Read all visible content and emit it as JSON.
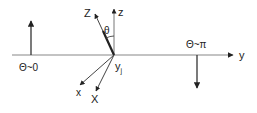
{
  "diagram": {
    "type": "coordinate-rotation-diagram",
    "colors": {
      "line": "#333333",
      "axis": "#777777",
      "background": "#ffffff"
    },
    "labels": {
      "y_axis": "y",
      "z_axis": "z",
      "Z_axis": "Z",
      "x_axis": "x",
      "X_axis": "X",
      "origin": "y",
      "origin_sub": "j",
      "angle": "θ",
      "left_state": "Θ~0",
      "right_state": "Θ~π"
    },
    "arrows": [
      {
        "name": "spin-up-arrow",
        "direction": "up",
        "label": "Θ~0"
      },
      {
        "name": "spin-down-arrow",
        "direction": "down",
        "label": "Θ~π"
      }
    ]
  }
}
